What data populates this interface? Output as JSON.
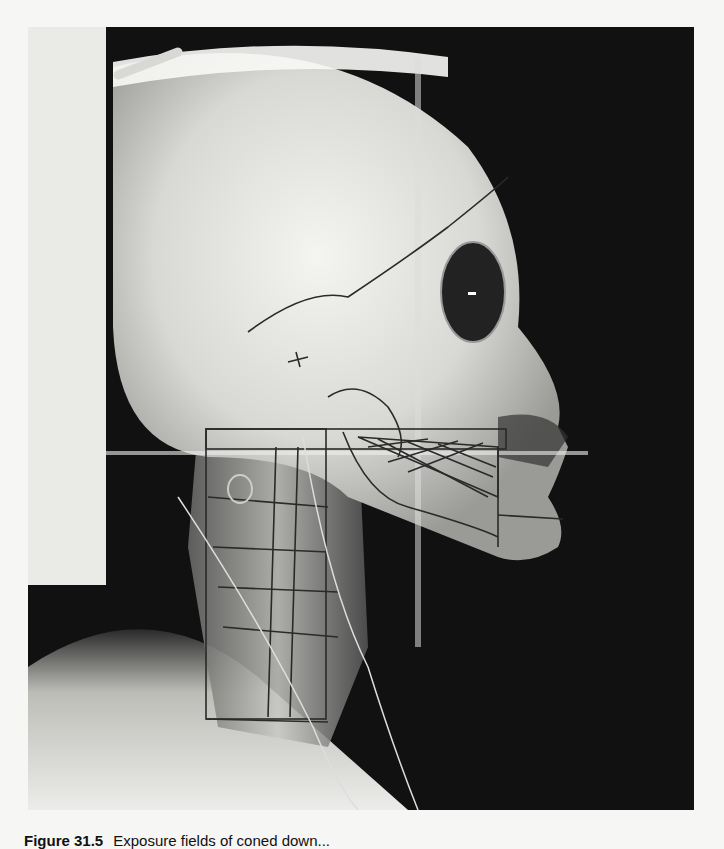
{
  "figure": {
    "colors": {
      "background_film": "#111111",
      "bone": "#e8e8e4",
      "markings": "#2a2a2a",
      "page": "#f6f6f4"
    }
  },
  "caption": {
    "label": "Figure 31.5",
    "text": "Exposure fields of coned down..."
  }
}
